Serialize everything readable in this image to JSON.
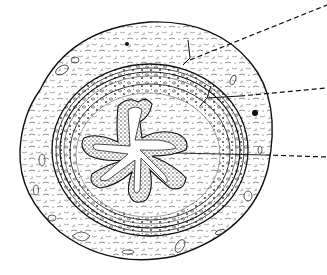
{
  "figure": {
    "style": "black ink line illustration on white",
    "background": "#ffffff",
    "ink": "#1a1a1a",
    "layers": [
      {
        "name": "adventitia",
        "description": "outer loose connective tissue with vessels"
      },
      {
        "name": "muscularis",
        "description": "concentric smooth muscle bands"
      },
      {
        "name": "lamina-propria",
        "description": "connective tissue beneath epithelium"
      },
      {
        "name": "transitional-epithelium",
        "description": "stippled folded lining around star-shaped lumen"
      },
      {
        "name": "lumen",
        "description": "central stellate opening"
      }
    ],
    "leader_lines": [
      {
        "id": 1,
        "target": "adventitia",
        "label": ""
      },
      {
        "id": 2,
        "target": "muscularis",
        "label": ""
      },
      {
        "id": 3,
        "target": "epithelium",
        "label": ""
      }
    ]
  }
}
